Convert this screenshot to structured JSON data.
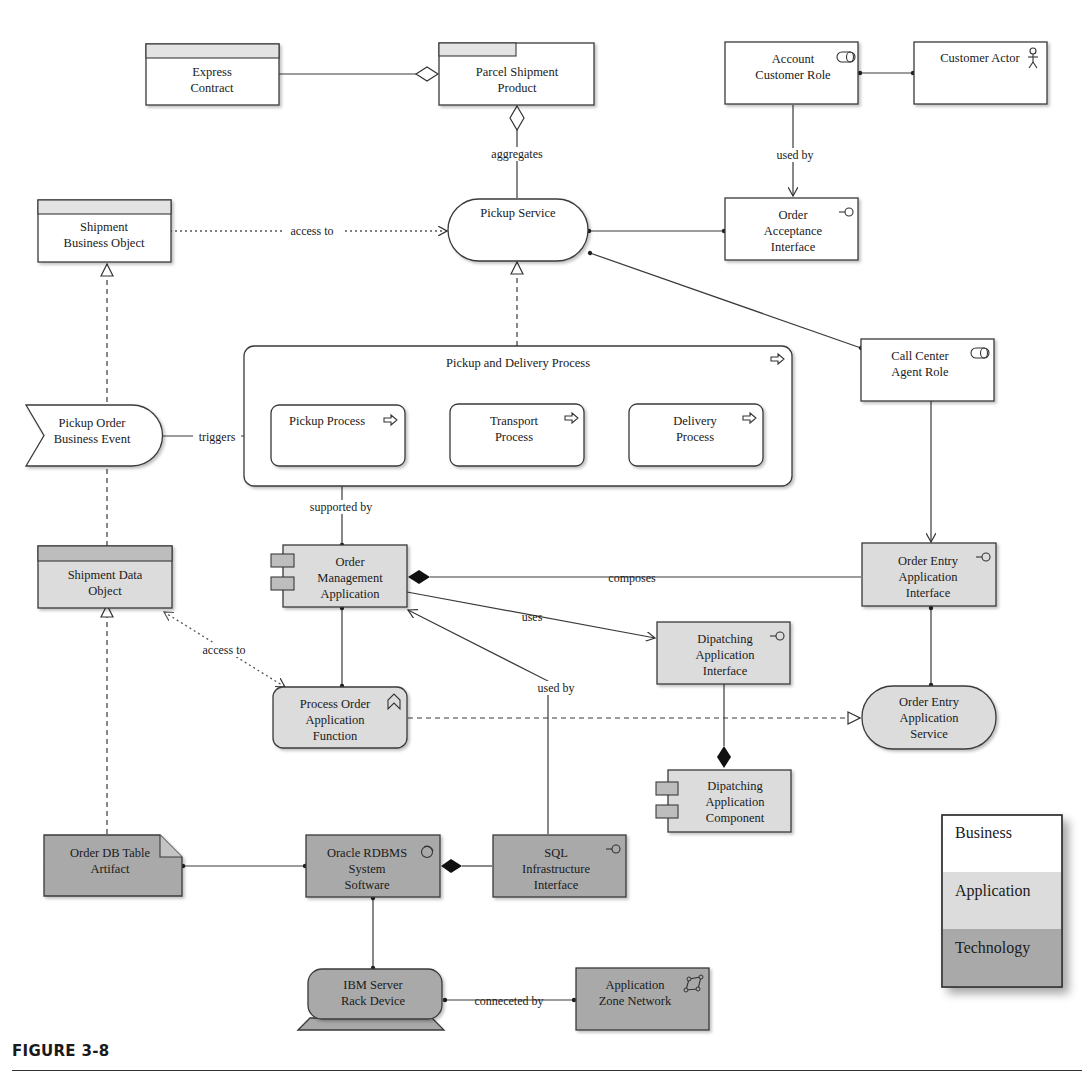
{
  "figure": {
    "caption": "FIGURE 3-8"
  },
  "nodes": {
    "express_contract": {
      "line1": "Express",
      "line2": "Contract",
      "layer": "business",
      "type": "contract"
    },
    "parcel_shipment_product": {
      "line1": "Parcel Shipment",
      "line2": "Product",
      "layer": "business",
      "type": "product"
    },
    "account_customer_role": {
      "line1": "Account",
      "line2": "Customer Role",
      "layer": "business",
      "type": "role",
      "icon": "role-icon"
    },
    "customer_actor": {
      "line1": "Customer Actor",
      "layer": "business",
      "type": "actor",
      "icon": "actor-icon"
    },
    "shipment_business_object": {
      "line1": "Shipment",
      "line2": "Business Object",
      "layer": "business",
      "type": "business-object"
    },
    "pickup_service": {
      "line1": "Pickup Service",
      "layer": "business",
      "type": "service"
    },
    "order_acceptance_interface": {
      "line1": "Order",
      "line2": "Acceptance",
      "line3": "Interface",
      "layer": "business",
      "type": "interface",
      "icon": "interface-icon"
    },
    "pickup_delivery_process": {
      "line1": "Pickup and Delivery Process",
      "layer": "business",
      "type": "process",
      "icon": "process-arrow-icon"
    },
    "pickup_order_event": {
      "line1": "Pickup Order",
      "line2": "Business Event",
      "layer": "business",
      "type": "event"
    },
    "pickup_process": {
      "line1": "Pickup Process",
      "layer": "business",
      "type": "process",
      "icon": "process-arrow-icon"
    },
    "transport_process": {
      "line1": "Transport",
      "line2": "Process",
      "layer": "business",
      "type": "process",
      "icon": "process-arrow-icon"
    },
    "delivery_process": {
      "line1": "Delivery",
      "line2": "Process",
      "layer": "business",
      "type": "process",
      "icon": "process-arrow-icon"
    },
    "call_center_agent_role": {
      "line1": "Call Center",
      "line2": "Agent Role",
      "layer": "business",
      "type": "role",
      "icon": "role-icon"
    },
    "shipment_data_object": {
      "line1": "Shipment Data",
      "line2": "Object",
      "layer": "application",
      "type": "data-object"
    },
    "order_management_application": {
      "line1": "Order",
      "line2": "Management",
      "line3": "Application",
      "layer": "application",
      "type": "component"
    },
    "order_entry_app_interface": {
      "line1": "Order Entry",
      "line2": "Application",
      "line3": "Interface",
      "layer": "application",
      "type": "interface",
      "icon": "interface-icon"
    },
    "dispatching_app_interface": {
      "line1": "Dipatching",
      "line2": "Application",
      "line3": "Interface",
      "layer": "application",
      "type": "interface",
      "icon": "interface-icon"
    },
    "process_order_function": {
      "line1": "Process Order",
      "line2": "Application",
      "line3": "Function",
      "layer": "application",
      "type": "function",
      "icon": "function-icon"
    },
    "order_entry_app_service": {
      "line1": "Order Entry",
      "line2": "Application",
      "line3": "Service",
      "layer": "application",
      "type": "service"
    },
    "dispatching_app_component": {
      "line1": "Dipatching",
      "line2": "Application",
      "line3": "Component",
      "layer": "application",
      "type": "component"
    },
    "order_db_table_artifact": {
      "line1": "Order DB Table",
      "line2": "Artifact",
      "layer": "technology",
      "type": "artifact"
    },
    "oracle_rdbms": {
      "line1": "Oracle RDBMS",
      "line2": "System",
      "line3": "Software",
      "layer": "technology",
      "type": "system-software",
      "icon": "system-software-icon"
    },
    "sql_infra_interface": {
      "line1": "SQL",
      "line2": "Infrastructure",
      "line3": "Interface",
      "layer": "technology",
      "type": "interface",
      "icon": "interface-icon"
    },
    "ibm_server_rack": {
      "line1": "IBM Server",
      "line2": "Rack Device",
      "layer": "technology",
      "type": "device"
    },
    "app_zone_network": {
      "line1": "Application",
      "line2": "Zone Network",
      "layer": "technology",
      "type": "network",
      "icon": "network-icon"
    }
  },
  "edges": {
    "aggregates": "aggregates",
    "used_by_top": "used by",
    "access_to_top": "access to",
    "triggers": "triggers",
    "supported_by": "supported by",
    "composes": "composes",
    "uses": "uses",
    "access_to_bottom": "access to",
    "used_by_bottom": "used by",
    "connected_by": "conneceted by"
  },
  "legend": {
    "items": [
      {
        "label": "Business",
        "color": "#ffffff"
      },
      {
        "label": "Application",
        "color": "#dcdcdc"
      },
      {
        "label": "Technology",
        "color": "#a9a9a9"
      }
    ]
  },
  "colors": {
    "business": "#ffffff",
    "application": "#dcdcdc",
    "technology": "#a9a9a9",
    "stroke": "#3a3a3a"
  }
}
